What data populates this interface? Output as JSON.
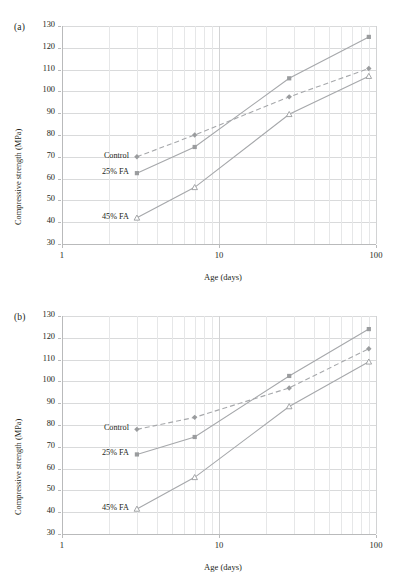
{
  "figure": {
    "panels": [
      {
        "tag": "(a)",
        "xlabel": "Age (days)",
        "ylabel": "Compressive strength (MPa)"
      },
      {
        "tag": "(b)",
        "xlabel": "Age (days)",
        "ylabel": "Compressive strength (MPa)"
      }
    ],
    "caption": "",
    "series_labels": {
      "control": "Control",
      "fa25": "25% FA",
      "fa45": "45% FA"
    },
    "colors": {
      "series_line": "#a6a8ab",
      "marker": "#9a9c9e",
      "grid": "#d9dadb",
      "grid_minor": "#e6e7e8",
      "axis": "#b9babb",
      "text": "#231f20"
    },
    "yticks": [
      "30",
      "40",
      "50",
      "60",
      "70",
      "80",
      "90",
      "100",
      "110",
      "120",
      "130"
    ],
    "xticks": [
      "1",
      "10",
      "100"
    ]
  },
  "chart_data": [
    {
      "type": "line",
      "title": "(a)",
      "xlabel": "Age (days)",
      "ylabel": "Compressive strength (MPa)",
      "xscale": "log",
      "xlim": [
        1,
        100
      ],
      "ylim": [
        30,
        130
      ],
      "ytick_step": 10,
      "grid": true,
      "legend": "inline-labels",
      "x": [
        3,
        7,
        28,
        90
      ],
      "series": [
        {
          "name": "Control",
          "marker": "diamond",
          "linestyle": "dashed",
          "values": [
            70.0,
            80.0,
            97.5,
            110.5
          ]
        },
        {
          "name": "25% FA",
          "marker": "square",
          "linestyle": "solid",
          "values": [
            62.5,
            74.5,
            106.0,
            125.0
          ]
        },
        {
          "name": "45% FA",
          "marker": "triangle",
          "linestyle": "solid",
          "values": [
            42.0,
            56.0,
            89.5,
            107.0
          ]
        }
      ]
    },
    {
      "type": "line",
      "title": "(b)",
      "xlabel": "Age (days)",
      "ylabel": "Compressive strength (MPa)",
      "xscale": "log",
      "xlim": [
        1,
        100
      ],
      "ylim": [
        30,
        130
      ],
      "ytick_step": 10,
      "grid": true,
      "legend": "inline-labels",
      "x": [
        3,
        7,
        28,
        90
      ],
      "series": [
        {
          "name": "Control",
          "marker": "diamond",
          "linestyle": "dashed",
          "values": [
            78.0,
            83.5,
            97.0,
            115.0
          ]
        },
        {
          "name": "25% FA",
          "marker": "square",
          "linestyle": "solid",
          "values": [
            66.5,
            74.5,
            102.5,
            124.0
          ]
        },
        {
          "name": "45% FA",
          "marker": "triangle",
          "linestyle": "solid",
          "values": [
            41.5,
            56.0,
            88.5,
            109.0
          ]
        }
      ]
    }
  ]
}
